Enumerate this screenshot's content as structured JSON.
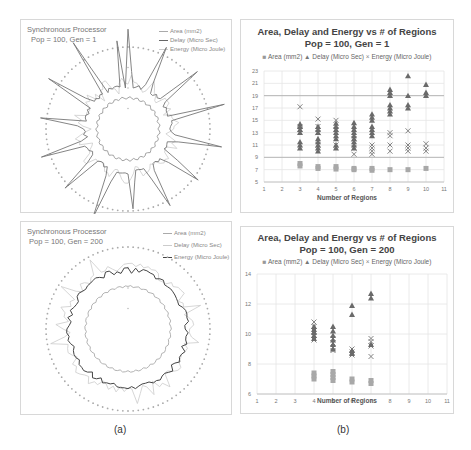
{
  "captions": {
    "a": "(a)",
    "b": "(b)"
  },
  "radar_panels": [
    {
      "title_line1": "Synchronous Processor",
      "title_line2": "Pop = 100, Gen = 1",
      "legend": [
        "Area (mm2)",
        "Delay (Micro Sec)",
        "Energy (Micro Joule)"
      ]
    },
    {
      "title_line1": "Synchronous Processor",
      "title_line2": "Pop = 100, Gen = 200",
      "legend": [
        "Area (mm2)",
        "Delay (Micro Sec)",
        "Energy (Micro Joule)"
      ]
    }
  ],
  "scatter_panels": [
    {
      "title_line1": "Area, Delay and Energy vs # of Regions",
      "title_line2": "Pop = 100, Gen = 1",
      "legend": {
        "area": "Area (mm2)",
        "delay": "Delay (Micro Sec)",
        "energy": "Energy (Micro Joule)"
      },
      "xlabel": "Number of Regions"
    },
    {
      "title_line1": "Area, Delay and Energy vs # of Regions",
      "title_line2": "Pop = 100, Gen = 200",
      "legend": {
        "area": "Area (mm2)",
        "delay": "Delay (Micro Sec)",
        "energy": "Energy (Micro Joule)"
      },
      "xlabel": "Number of Regions"
    }
  ],
  "chart_data": [
    {
      "type": "radar",
      "title": "Synchronous Processor Pop = 100, Gen = 1",
      "series": [
        {
          "name": "Area (mm2)",
          "description": "inner near-circular ring"
        },
        {
          "name": "Delay (Micro Sec)",
          "description": "spiky outer star shape"
        },
        {
          "name": "Energy (Micro Joule)",
          "description": "light ring between area and delay"
        }
      ],
      "axis_points": 100,
      "legend_position": "top-right"
    },
    {
      "type": "scatter",
      "title": "Area, Delay and Energy vs # of Regions",
      "subtitle": "Pop = 100, Gen = 1",
      "xlabel": "Number of Regions",
      "ylabel": "",
      "xlim": [
        1,
        11
      ],
      "ylim": [
        5,
        23
      ],
      "xticks": [
        1,
        2,
        3,
        4,
        5,
        6,
        7,
        8,
        9,
        10,
        11
      ],
      "yticks": [
        5,
        7,
        9,
        11,
        13,
        15,
        17,
        19,
        21,
        23
      ],
      "grid": true,
      "legend_position": "top",
      "series": [
        {
          "name": "Area (mm2)",
          "marker": "square",
          "points": [
            [
              3,
              7.6
            ],
            [
              3,
              8.0
            ],
            [
              4,
              7.2
            ],
            [
              4,
              7.5
            ],
            [
              5,
              7.1
            ],
            [
              5,
              7.5
            ],
            [
              6,
              7.0
            ],
            [
              6,
              7.2
            ],
            [
              7,
              6.9
            ],
            [
              7,
              7.2
            ],
            [
              8,
              7.0
            ],
            [
              9,
              7.0
            ],
            [
              10,
              7.2
            ]
          ]
        },
        {
          "name": "Delay (Micro Sec)",
          "marker": "triangle",
          "points": [
            [
              3,
              10.5
            ],
            [
              3,
              11.0
            ],
            [
              3,
              11.5
            ],
            [
              3,
              13.0
            ],
            [
              3,
              13.5
            ],
            [
              3,
              14.0
            ],
            [
              3,
              14.4
            ],
            [
              4,
              10.0
            ],
            [
              4,
              10.5
            ],
            [
              4,
              11.0
            ],
            [
              4,
              11.5
            ],
            [
              4,
              12.0
            ],
            [
              4,
              13.0
            ],
            [
              4,
              13.5
            ],
            [
              4,
              14.0
            ],
            [
              5,
              10.5
            ],
            [
              5,
              11.0
            ],
            [
              5,
              12.0
            ],
            [
              5,
              12.5
            ],
            [
              5,
              13.0
            ],
            [
              5,
              13.5
            ],
            [
              5,
              14.0
            ],
            [
              5,
              14.5
            ],
            [
              6,
              10.5
            ],
            [
              6,
              11.0
            ],
            [
              6,
              11.5
            ],
            [
              6,
              12.0
            ],
            [
              6,
              12.5
            ],
            [
              6,
              13.0
            ],
            [
              6,
              13.5
            ],
            [
              6,
              14.0
            ],
            [
              6,
              14.6
            ],
            [
              7,
              12.5
            ],
            [
              7,
              13.0
            ],
            [
              7,
              13.5
            ],
            [
              7,
              14.0
            ],
            [
              7,
              15.0
            ],
            [
              7,
              15.5
            ],
            [
              7,
              16.0
            ],
            [
              8,
              16.0
            ],
            [
              8,
              16.5
            ],
            [
              8,
              17.0
            ],
            [
              8,
              17.5
            ],
            [
              8,
              19.0
            ],
            [
              8,
              19.5
            ],
            [
              8,
              20.0
            ],
            [
              9,
              17.0
            ],
            [
              9,
              17.5
            ],
            [
              9,
              19.0
            ],
            [
              9,
              22.2
            ],
            [
              10,
              19.0
            ],
            [
              10,
              19.5
            ],
            [
              10,
              20.8
            ]
          ]
        },
        {
          "name": "Energy (Micro Joule)",
          "marker": "x",
          "points": [
            [
              3,
              17.2
            ],
            [
              3,
              13.5
            ],
            [
              3,
              14.0
            ],
            [
              4,
              15.2
            ],
            [
              4,
              14.0
            ],
            [
              4,
              13.0
            ],
            [
              4,
              11.0
            ],
            [
              5,
              15.0
            ],
            [
              5,
              13.5
            ],
            [
              5,
              11.0
            ],
            [
              6,
              9.5
            ],
            [
              6,
              10.5
            ],
            [
              6,
              12.0
            ],
            [
              7,
              9.5
            ],
            [
              7,
              10.0
            ],
            [
              7,
              10.5
            ],
            [
              7,
              11.0
            ],
            [
              8,
              10.0
            ],
            [
              8,
              11.0
            ],
            [
              8,
              12.5
            ],
            [
              8,
              13.0
            ],
            [
              9,
              10.0
            ],
            [
              9,
              10.5
            ],
            [
              9,
              11.0
            ],
            [
              9,
              13.3
            ],
            [
              10,
              10.0
            ],
            [
              10,
              10.5
            ],
            [
              10,
              11.2
            ]
          ]
        }
      ]
    },
    {
      "type": "radar",
      "title": "Synchronous Processor Pop = 100, Gen = 200",
      "series": [
        {
          "name": "Area (mm2)",
          "description": "inner near-circular ring"
        },
        {
          "name": "Delay (Micro Sec)",
          "description": "light spiky outer shape"
        },
        {
          "name": "Energy (Micro Joule)",
          "description": "dark jagged ring"
        }
      ],
      "axis_points": 100,
      "legend_position": "top-right"
    },
    {
      "type": "scatter",
      "title": "Area, Delay and Energy vs # of Regions",
      "subtitle": "Pop = 100, Gen = 200",
      "xlabel": "Number of Regions",
      "ylabel": "",
      "xlim": [
        1,
        11
      ],
      "ylim": [
        6,
        14
      ],
      "xticks": [
        1,
        2,
        3,
        4,
        5,
        6,
        7,
        8,
        9,
        10,
        11
      ],
      "yticks": [
        6,
        8,
        10,
        12,
        14
      ],
      "grid": true,
      "legend_position": "top",
      "series": [
        {
          "name": "Area (mm2)",
          "marker": "square",
          "points": [
            [
              4,
              7.0
            ],
            [
              4,
              7.2
            ],
            [
              4,
              7.4
            ],
            [
              5,
              6.9
            ],
            [
              5,
              7.1
            ],
            [
              5,
              7.3
            ],
            [
              5,
              7.5
            ],
            [
              6,
              6.8
            ],
            [
              6,
              7.0
            ],
            [
              7,
              6.7
            ],
            [
              7,
              6.9
            ]
          ]
        },
        {
          "name": "Delay (Micro Sec)",
          "marker": "triangle",
          "points": [
            [
              4,
              9.7
            ],
            [
              4,
              9.9
            ],
            [
              4,
              10.1
            ],
            [
              4,
              10.3
            ],
            [
              4,
              10.5
            ],
            [
              5,
              9.0
            ],
            [
              5,
              9.3
            ],
            [
              5,
              9.6
            ],
            [
              5,
              9.9
            ],
            [
              5,
              10.2
            ],
            [
              5,
              10.5
            ],
            [
              6,
              8.7
            ],
            [
              6,
              8.9
            ],
            [
              6,
              11.3
            ],
            [
              6,
              11.9
            ],
            [
              7,
              9.3
            ],
            [
              7,
              12.4
            ],
            [
              7,
              12.7
            ]
          ]
        },
        {
          "name": "Energy (Micro Joule)",
          "marker": "x",
          "points": [
            [
              4,
              9.6
            ],
            [
              4,
              9.9
            ],
            [
              4,
              10.2
            ],
            [
              4,
              10.5
            ],
            [
              4,
              10.8
            ],
            [
              5,
              8.9
            ],
            [
              5,
              9.1
            ],
            [
              5,
              9.4
            ],
            [
              5,
              9.7
            ],
            [
              6,
              8.6
            ],
            [
              6,
              8.8
            ],
            [
              6,
              9.0
            ],
            [
              7,
              8.5
            ],
            [
              7,
              9.2
            ],
            [
              7,
              9.5
            ],
            [
              7,
              9.7
            ]
          ]
        }
      ]
    }
  ]
}
